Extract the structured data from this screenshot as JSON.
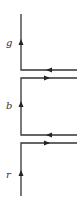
{
  "diagram": {
    "labels": [
      {
        "text": "g",
        "x": 6,
        "y": 46
      },
      {
        "text": "b",
        "x": 6,
        "y": 109
      },
      {
        "text": "r",
        "x": 6,
        "y": 178
      }
    ],
    "colors": {
      "line": "#333333",
      "arrow": "#222222",
      "background": "#ffffff"
    }
  }
}
